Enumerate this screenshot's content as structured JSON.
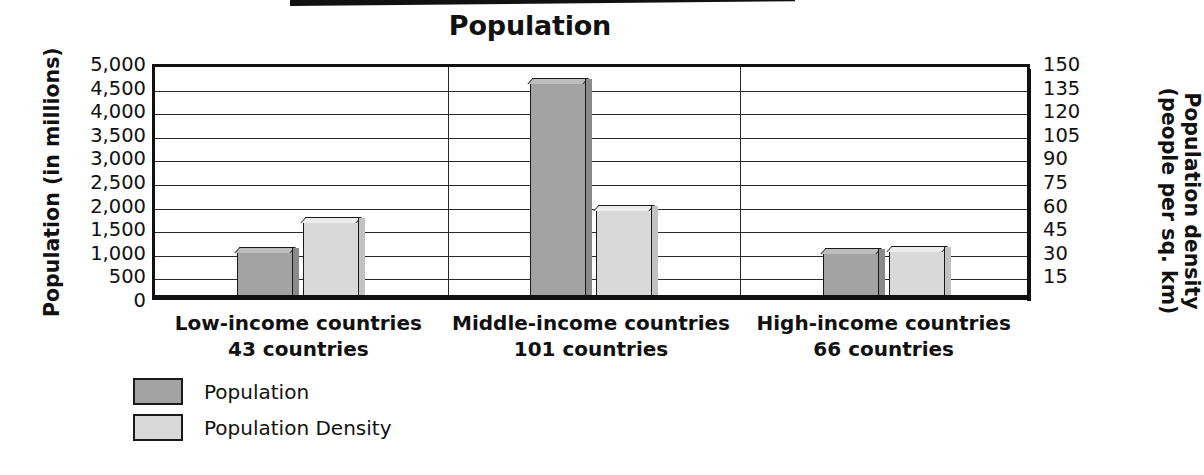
{
  "title": "Population",
  "decoration": {
    "top_rule": "black-rule"
  },
  "axes": {
    "left": {
      "title": "Population (in millions)",
      "ticks": [
        "5,000",
        "4,500",
        "4,000",
        "3,500",
        "3,000",
        "2,500",
        "2,000",
        "1,500",
        "1,000",
        "500",
        "0"
      ],
      "min": 0,
      "max": 5000
    },
    "right": {
      "title_line1": "Population density",
      "title_line2": "(people per sq. km)",
      "ticks": [
        "150",
        "135",
        "120",
        "105",
        "90",
        "75",
        "60",
        "45",
        "30",
        "15"
      ],
      "min": 0,
      "max": 150
    }
  },
  "categories": [
    {
      "name": "Low-income countries",
      "count_label": "43 countries"
    },
    {
      "name": "Middle-income countries",
      "count_label": "101 countries"
    },
    {
      "name": "High-income countries",
      "count_label": "66 countries"
    }
  ],
  "legend": [
    {
      "label": "Population",
      "color": "#a3a3a3"
    },
    {
      "label": "Population Density",
      "color": "#d9d9d9"
    }
  ],
  "colors": {
    "population": "#a3a3a3",
    "population_density": "#d9d9d9",
    "ink": "#111111",
    "background": "#ffffff"
  },
  "chart_data": {
    "type": "bar",
    "title": "Population",
    "xlabel": "",
    "ylabel": "Population (in millions)",
    "y2label": "Population density (people per sq. km)",
    "categories": [
      "Low-income countries",
      "Middle-income countries",
      "High-income countries"
    ],
    "category_sublabels": [
      "43 countries",
      "101 countries",
      "66 countries"
    ],
    "grid": true,
    "legend_position": "below-left",
    "ylim": [
      0,
      5000
    ],
    "y2lim": [
      0,
      150
    ],
    "yticks": [
      0,
      500,
      1000,
      1500,
      2000,
      2500,
      3000,
      3500,
      4000,
      4500,
      5000
    ],
    "y2ticks": [
      15,
      30,
      45,
      60,
      75,
      90,
      105,
      120,
      135,
      150
    ],
    "series": [
      {
        "name": "Population",
        "axis": "left",
        "unit": "millions",
        "values": [
          980,
          4550,
          950
        ],
        "color": "#a3a3a3"
      },
      {
        "name": "Population Density",
        "axis": "right",
        "unit": "people per sq. km",
        "values": [
          48,
          56,
          30
        ],
        "color": "#d9d9d9"
      }
    ]
  }
}
